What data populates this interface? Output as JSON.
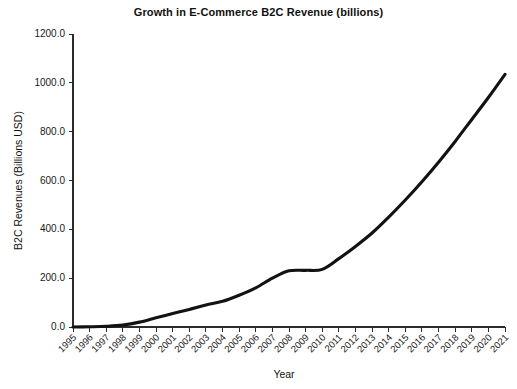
{
  "chart_data": {
    "type": "line",
    "title": "Growth in E-Commerce B2C Revenue (billions)",
    "xlabel": "Year",
    "ylabel": "B2C Revenues (Billions USD)",
    "categories": [
      "1995",
      "1996",
      "1997",
      "1998",
      "1999",
      "2000",
      "2001",
      "2002",
      "2003",
      "2004",
      "2005",
      "2006",
      "2007",
      "2008",
      "2009",
      "2010",
      "2011",
      "2012",
      "2013",
      "2014",
      "2015",
      "2016",
      "2017",
      "2018",
      "2019",
      "2020",
      "2021"
    ],
    "values": [
      0.0,
      1.0,
      3.0,
      8.0,
      20.0,
      38.0,
      55.0,
      72.0,
      90.0,
      105.0,
      130.0,
      160.0,
      200.0,
      230.0,
      232.0,
      236.0,
      280.0,
      330.0,
      385.0,
      450.0,
      520.0,
      595.0,
      675.0,
      760.0,
      850.0,
      940.0,
      1035.0
    ],
    "ylim": [
      0.0,
      1200.0
    ],
    "ytick_values": [
      0.0,
      200.0,
      400.0,
      600.0,
      800.0,
      1000.0,
      1200.0
    ],
    "ytick_labels": [
      "0.0",
      "200.0",
      "400.0",
      "600.0",
      "800.0",
      "1000.0",
      "1200.0"
    ],
    "grid": false,
    "legend": false,
    "line_color": "#121212",
    "axis_color": "#2b2b2b",
    "background_color": "#ffffff",
    "xtick_rotation_degrees": 45
  }
}
